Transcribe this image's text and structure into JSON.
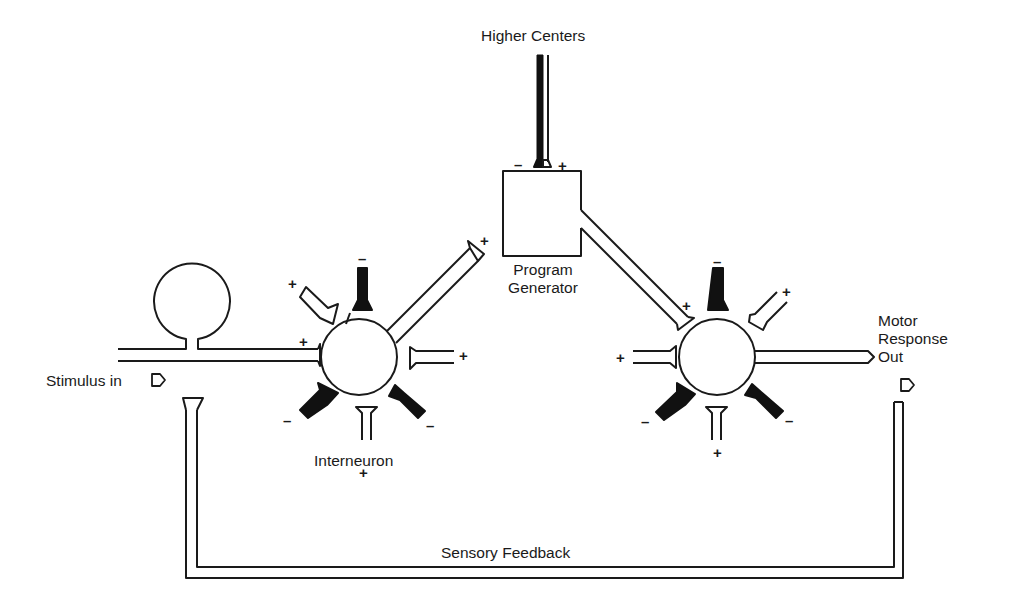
{
  "diagram": {
    "type": "neural-circuit",
    "labels": {
      "higher_centers": "Higher Centers",
      "program_generator_line1": "Program",
      "program_generator_line2": "Generator",
      "stimulus_in": "Stimulus in",
      "interneuron": "Interneuron",
      "motor_line1": "Motor",
      "motor_line2": "Response",
      "motor_line3": "Out",
      "sensory_feedback": "Sensory Feedback"
    },
    "signs": {
      "plus": "+",
      "minus": "–"
    },
    "colors": {
      "stroke": "#1a1a1a",
      "inhibitory_fill": "#111111",
      "background": "#ffffff"
    },
    "nodes": [
      {
        "id": "sensory-neuron",
        "shape": "circle"
      },
      {
        "id": "interneuron",
        "shape": "circle",
        "inputs": [
          "+",
          "+",
          "–",
          "–",
          "–",
          "+",
          "+"
        ]
      },
      {
        "id": "program-generator",
        "shape": "square",
        "inputs": [
          "–",
          "+"
        ]
      },
      {
        "id": "motor-neuron",
        "shape": "circle",
        "inputs": [
          "+",
          "–",
          "+",
          "+",
          "–",
          "–",
          "+"
        ]
      }
    ],
    "connections": [
      {
        "from": "Stimulus in",
        "to": "interneuron",
        "sign": "+"
      },
      {
        "from": "interneuron",
        "to": "program-generator",
        "sign": "+"
      },
      {
        "from": "Higher Centers",
        "to": "program-generator",
        "sign": "–/+"
      },
      {
        "from": "program-generator",
        "to": "motor-neuron",
        "sign": "+"
      },
      {
        "from": "motor-neuron",
        "to": "Motor Response Out"
      },
      {
        "from": "Motor Response Out",
        "to": "Stimulus in",
        "label": "Sensory Feedback"
      }
    ]
  }
}
